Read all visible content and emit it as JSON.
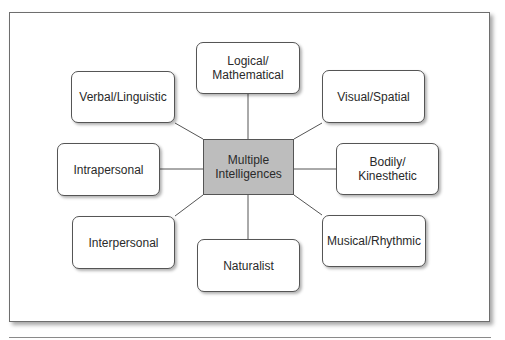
{
  "diagram": {
    "center": {
      "label": "Multiple\nIntelligences",
      "fill": "#bdbdbd"
    },
    "nodes": [
      {
        "id": "logical",
        "label": "Logical/\nMathematical"
      },
      {
        "id": "verbal",
        "label": "Verbal/Linguistic"
      },
      {
        "id": "visual",
        "label": "Visual/Spatial"
      },
      {
        "id": "intrapersonal",
        "label": "Intrapersonal"
      },
      {
        "id": "bodily",
        "label": "Bodily/\nKinesthetic"
      },
      {
        "id": "interpersonal",
        "label": "Interpersonal"
      },
      {
        "id": "naturalist",
        "label": "Naturalist"
      },
      {
        "id": "musical",
        "label": "Musical/Rhythmic"
      }
    ]
  }
}
